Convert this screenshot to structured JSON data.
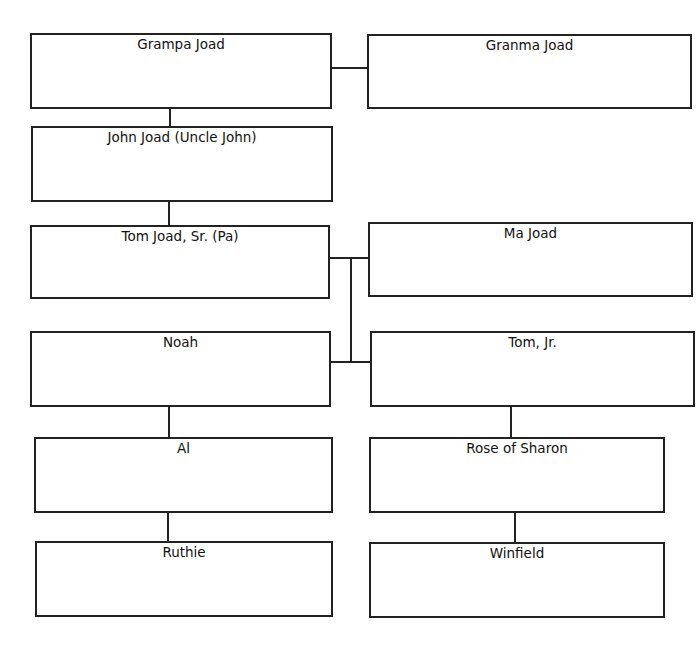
{
  "diagram": {
    "type": "family-tree",
    "nodes": [
      {
        "id": "grampa",
        "label": "Grampa Joad"
      },
      {
        "id": "granma",
        "label": "Granma Joad"
      },
      {
        "id": "uncle_john",
        "label": "John Joad (Uncle John)"
      },
      {
        "id": "pa",
        "label": "Tom Joad, Sr. (Pa)"
      },
      {
        "id": "ma",
        "label": "Ma Joad"
      },
      {
        "id": "noah",
        "label": "Noah"
      },
      {
        "id": "tom_jr",
        "label": "Tom, Jr."
      },
      {
        "id": "al",
        "label": "Al"
      },
      {
        "id": "rose",
        "label": "Rose of Sharon"
      },
      {
        "id": "ruthie",
        "label": "Ruthie"
      },
      {
        "id": "winfield",
        "label": "Winfield"
      }
    ],
    "edges": [
      [
        "grampa",
        "granma"
      ],
      [
        "grampa",
        "uncle_john"
      ],
      [
        "uncle_john",
        "pa"
      ],
      [
        "pa",
        "ma"
      ],
      [
        "pa",
        "noah"
      ],
      [
        "ma",
        "tom_jr"
      ],
      [
        "noah",
        "al"
      ],
      [
        "al",
        "ruthie"
      ],
      [
        "tom_jr",
        "rose"
      ],
      [
        "rose",
        "winfield"
      ]
    ]
  }
}
